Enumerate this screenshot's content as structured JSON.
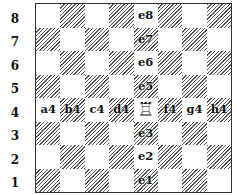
{
  "diagram": {
    "title": "",
    "ranks": [
      "8",
      "7",
      "6",
      "5",
      "4",
      "3",
      "2",
      "1"
    ],
    "files": [
      "a",
      "b",
      "c",
      "d",
      "e",
      "f",
      "g",
      "h"
    ],
    "piece": {
      "type": "rook",
      "color": "white",
      "square": "e4",
      "glyph": "♖"
    },
    "marked_squares": {
      "e8": "e8",
      "e7": "e7",
      "e6": "e6",
      "e5": "e5",
      "a4": "a4",
      "b4": "b4",
      "c4": "c4",
      "d4": "d4",
      "f4": "f4",
      "g4": "g4",
      "h4": "h4",
      "e3": "e3",
      "e2": "e2",
      "e1": "e1"
    },
    "colors": {
      "border": "#333333",
      "dark_hatch": "#555555",
      "light": "#ffffff",
      "text": "#111111"
    }
  }
}
